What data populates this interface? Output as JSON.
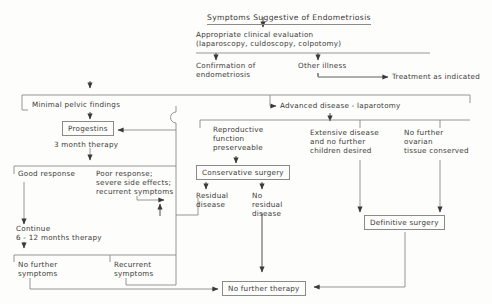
{
  "diagram": {
    "title": "Symptoms Suggestive of Endometriosis",
    "nodes": {
      "title": "Symptoms Suggestive of Endometriosis",
      "evaluation": "Appropriate clinical evaluation\n(laparoscopy, culdoscopy, colpotomy)",
      "confirmation": "Confirmation of\nendometriosis",
      "other_illness": "Other illness",
      "treatment_indicated": "Treatment as indicated",
      "minimal_findings": "Minimal pelvic findings",
      "progestins": "Progestins",
      "three_month": "3 month therapy",
      "good_response": "Good response",
      "poor_response": "Poor response;\nsevere side effects;\nrecurrent symptoms",
      "continue_therapy": "Continue\n6 - 12 months therapy",
      "no_further_symptoms": "No further\nsymptoms",
      "recurrent_symptoms": "Recurrent\nsymptoms",
      "advanced_disease": "Advanced disease - laparotomy",
      "reproductive": "Reproductive\nfunction\npreserveable",
      "conservative_surgery": "Conservative surgery",
      "residual": "Residual\ndisease",
      "no_residual": "No\nresidual\ndisease",
      "extensive": "Extensive disease\nand no further\nchildren desired",
      "no_ovarian": "No further\novarian\ntissue conserved",
      "definitive_surgery": "Definitive surgery",
      "no_further_therapy": "No further therapy"
    },
    "colors": {
      "line": "#8a8a86",
      "text": "#3a3a38",
      "background": "#fdfdfb"
    }
  }
}
